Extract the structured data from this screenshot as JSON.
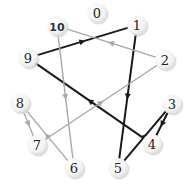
{
  "diagram": {
    "type": "directed-graph",
    "colors": {
      "dark_edge": "#1a1a1a",
      "light_edge": "#a8a8a8",
      "node_fill": "#f4f4f4",
      "node_shadow": "#d2d2d2",
      "label": "#222222"
    },
    "nodes": [
      {
        "id": "0",
        "label": "0",
        "x": 97,
        "y": 13
      },
      {
        "id": "1",
        "label": "1",
        "x": 137,
        "y": 25
      },
      {
        "id": "2",
        "label": "2",
        "x": 165,
        "y": 60
      },
      {
        "id": "3",
        "label": "3",
        "x": 172,
        "y": 104
      },
      {
        "id": "4",
        "label": "4",
        "x": 152,
        "y": 144
      },
      {
        "id": "5",
        "label": "5",
        "x": 118,
        "y": 168
      },
      {
        "id": "6",
        "label": "6",
        "x": 74,
        "y": 168
      },
      {
        "id": "7",
        "label": "7",
        "x": 37,
        "y": 145
      },
      {
        "id": "8",
        "label": "8",
        "x": 20,
        "y": 103
      },
      {
        "id": "9",
        "label": "9",
        "x": 28,
        "y": 58
      },
      {
        "id": "10",
        "label": "10",
        "x": 57,
        "y": 26
      }
    ],
    "edges": [
      {
        "from": "9",
        "to": "1",
        "style": "dark"
      },
      {
        "from": "1",
        "to": "5",
        "style": "dark"
      },
      {
        "from": "4",
        "to": "9",
        "style": "dark"
      },
      {
        "from": "5",
        "to": "3",
        "style": "dark"
      },
      {
        "from": "3",
        "to": "4",
        "style": "dark"
      },
      {
        "from": "2",
        "to": "10",
        "style": "light"
      },
      {
        "from": "10",
        "to": "6",
        "style": "light"
      },
      {
        "from": "7",
        "to": "2",
        "style": "light"
      },
      {
        "from": "6",
        "to": "8",
        "style": "light"
      },
      {
        "from": "8",
        "to": "7",
        "style": "light"
      }
    ]
  }
}
